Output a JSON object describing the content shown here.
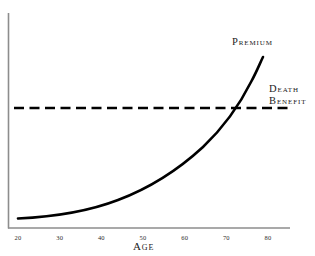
{
  "chart_data": {
    "type": "line",
    "title": "",
    "xlabel": "Age",
    "ylabel": "",
    "xlim": [
      16,
      84
    ],
    "ylim": [
      0,
      100
    ],
    "grid": false,
    "legend_position": "inline-annotations",
    "categories": [],
    "xticks": [
      "20",
      "30",
      "40",
      "50",
      "60",
      "70",
      "80"
    ],
    "xtick_values": [
      20,
      30,
      40,
      50,
      60,
      70,
      80
    ],
    "series": [
      {
        "name": "Premium",
        "style": "solid",
        "color": "#000000",
        "x": [
          20,
          25,
          30,
          35,
          40,
          45,
          50,
          55,
          60,
          65,
          70,
          75,
          79
        ],
        "values": [
          4,
          5,
          7,
          9,
          12,
          16,
          21,
          28,
          37,
          49,
          65,
          86,
          100
        ]
      },
      {
        "name": "Death Benefit",
        "style": "dashed",
        "color": "#000000",
        "x": [
          16,
          84
        ],
        "values": [
          55,
          55
        ]
      }
    ],
    "annotations": [
      {
        "text": "Premium",
        "x": 79,
        "y": 100
      },
      {
        "text": "Death Benefit",
        "x": 84,
        "y": 55
      }
    ],
    "crossover": {
      "x": 74,
      "y": 55
    }
  },
  "labels": {
    "premium": "Premium",
    "death_benefit_line1": "Death",
    "death_benefit_line2": "Benefit",
    "age_axis_title": "Age"
  },
  "colors": {
    "background": "#ffffff",
    "curve": "#000000",
    "dashed_line": "#000000",
    "axis": "#8d8d8d",
    "text": "#1a1a1a"
  }
}
